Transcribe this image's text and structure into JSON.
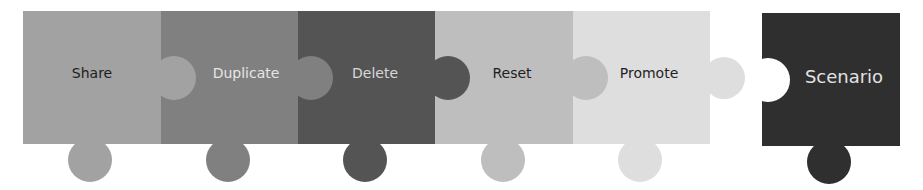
{
  "diagram": {
    "type": "puzzle-sequence",
    "pieces": [
      {
        "label": "Share",
        "color": "#a2a2a2",
        "text_color": "#1e1e1e"
      },
      {
        "label": "Duplicate",
        "color": "#808080",
        "text_color": "#e6e6e6"
      },
      {
        "label": "Delete",
        "color": "#545454",
        "text_color": "#d8d8d8"
      },
      {
        "label": "Reset",
        "color": "#bebebe",
        "text_color": "#1e1e1e"
      },
      {
        "label": "Promote",
        "color": "#dedede",
        "text_color": "#1e1e1e"
      }
    ],
    "detached_piece": {
      "label": "Scenario",
      "color": "#2f2f2f",
      "text_color": "#e2e2e2"
    }
  }
}
